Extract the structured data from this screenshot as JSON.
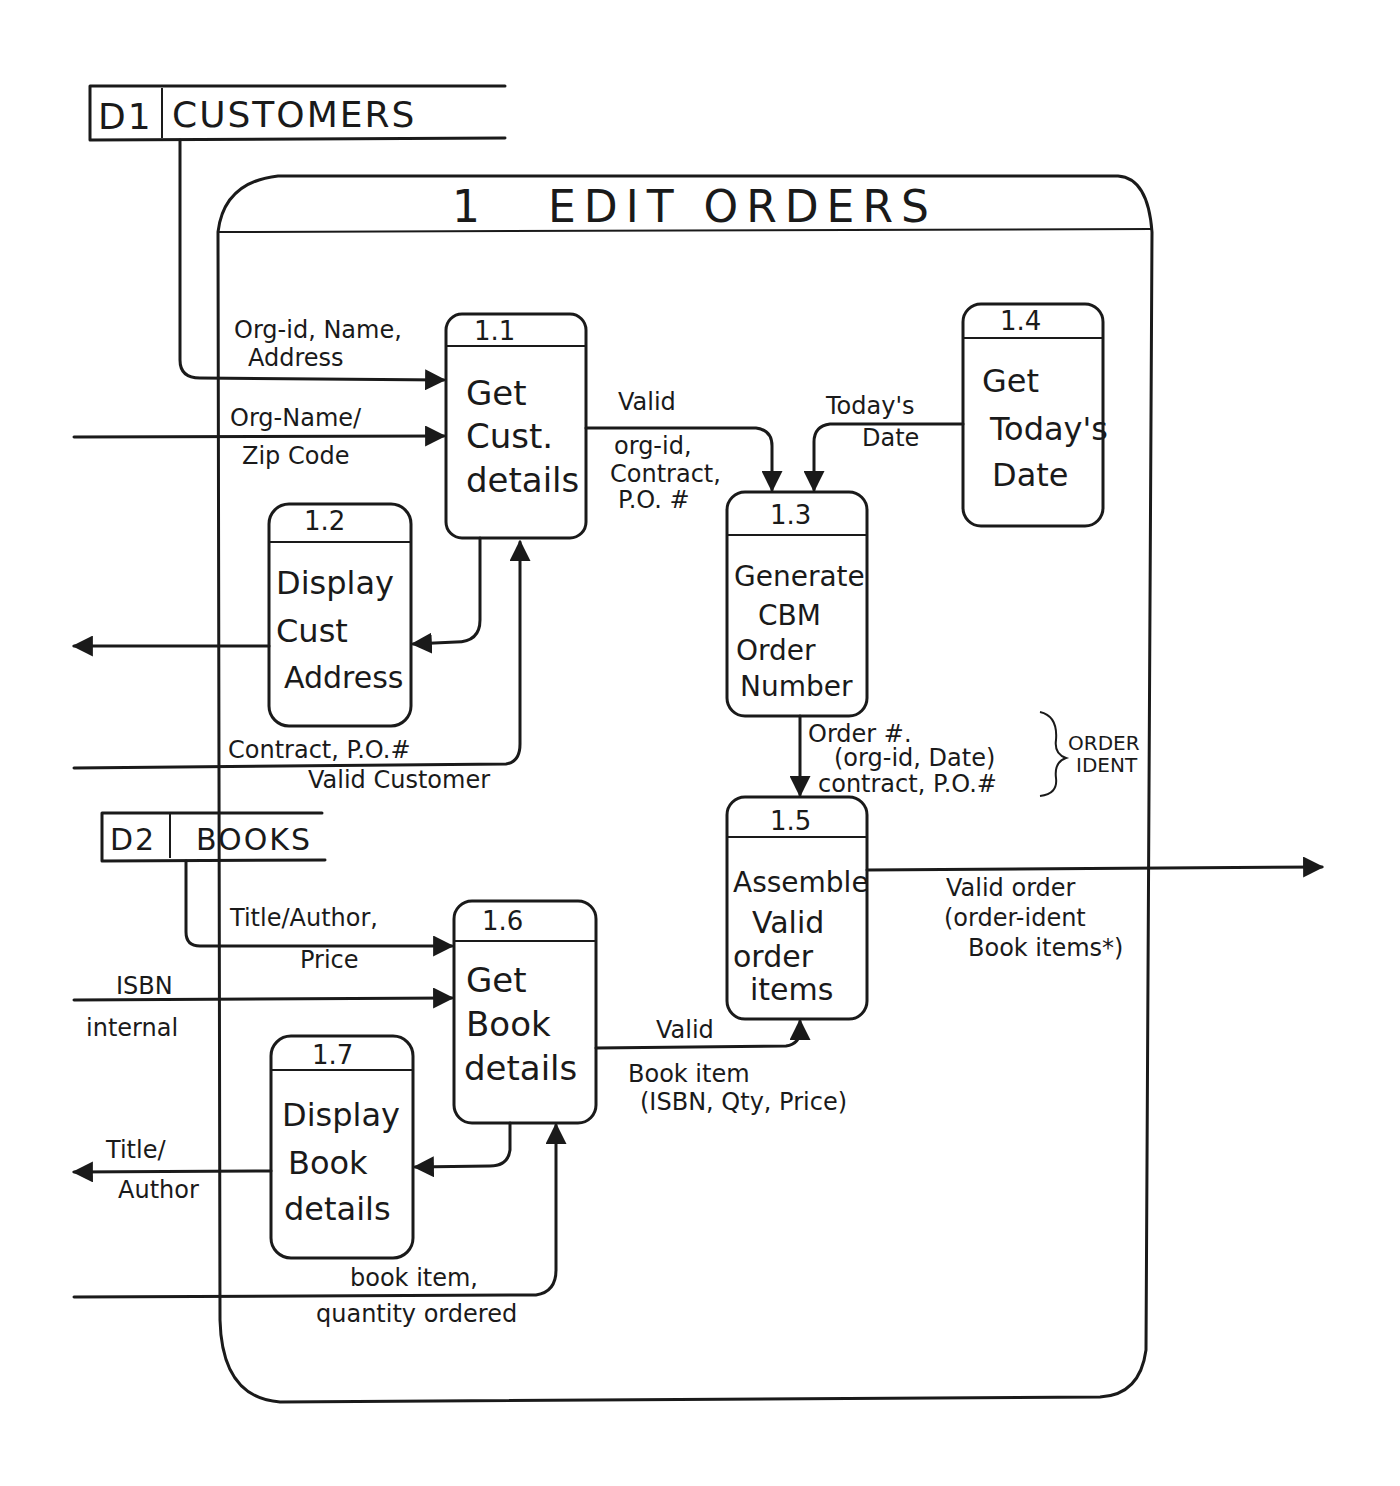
{
  "diagram": {
    "type": "data-flow-diagram",
    "parent_process": {
      "id": "1",
      "title": "EDIT ORDERS"
    },
    "data_stores": [
      {
        "id": "D1",
        "name": "CUSTOMERS"
      },
      {
        "id": "D2",
        "name": "BOOKS"
      }
    ],
    "processes": [
      {
        "id": "1.1",
        "lines": [
          "Get",
          "Cust.",
          "details"
        ]
      },
      {
        "id": "1.2",
        "lines": [
          "Display",
          "Cust",
          "Address"
        ]
      },
      {
        "id": "1.3",
        "lines": [
          "Generate",
          "CBM",
          "Order",
          "Number"
        ]
      },
      {
        "id": "1.4",
        "lines": [
          "Get",
          "Today's",
          "Date"
        ]
      },
      {
        "id": "1.5",
        "lines": [
          "Assemble",
          "Valid",
          "order",
          "items"
        ]
      },
      {
        "id": "1.6",
        "lines": [
          "Get",
          "Book",
          "details"
        ]
      },
      {
        "id": "1.7",
        "lines": [
          "Display",
          "Book",
          "details"
        ]
      }
    ],
    "flows": [
      {
        "from": "D1",
        "to": "1.1",
        "lines": [
          "Org-id, Name,",
          "Address"
        ]
      },
      {
        "from": "external",
        "to": "1.1",
        "lines": [
          "Org-Name/",
          "Zip Code"
        ]
      },
      {
        "from": "1.1",
        "to": "1.2",
        "lines": []
      },
      {
        "from": "1.2",
        "to": "external",
        "lines": []
      },
      {
        "from": "external",
        "to": "1.1",
        "lines": [
          "Contract, P.O.#",
          "Valid Customer"
        ]
      },
      {
        "from": "1.1",
        "to": "1.3",
        "lines": [
          "Valid",
          "org-id,",
          "Contract,",
          "P.O. #"
        ]
      },
      {
        "from": "1.4",
        "to": "1.3",
        "lines": [
          "Today's",
          "Date"
        ]
      },
      {
        "from": "1.3",
        "to": "1.5",
        "lines": [
          "Order #.",
          "(org-id, Date)",
          "contract, P.O.#"
        ],
        "annotation": [
          "ORDER",
          "IDENT"
        ]
      },
      {
        "from": "1.5",
        "to": "external",
        "lines": [
          "Valid order",
          "(order-ident",
          "Book items*)"
        ]
      },
      {
        "from": "D2",
        "to": "1.6",
        "lines": [
          "Title/Author,",
          "Price"
        ]
      },
      {
        "from": "external",
        "to": "1.6",
        "lines": [
          "ISBN",
          "internal"
        ]
      },
      {
        "from": "1.6",
        "to": "1.7",
        "lines": []
      },
      {
        "from": "1.7",
        "to": "external",
        "lines": [
          "Title/",
          "Author"
        ]
      },
      {
        "from": "1.6",
        "to": "1.5",
        "lines": [
          "Valid",
          "Book item",
          "(ISBN, Qty, Price)"
        ]
      },
      {
        "from": "external",
        "to": "1.6",
        "lines": [
          "book item,",
          "quantity ordered"
        ]
      }
    ]
  }
}
